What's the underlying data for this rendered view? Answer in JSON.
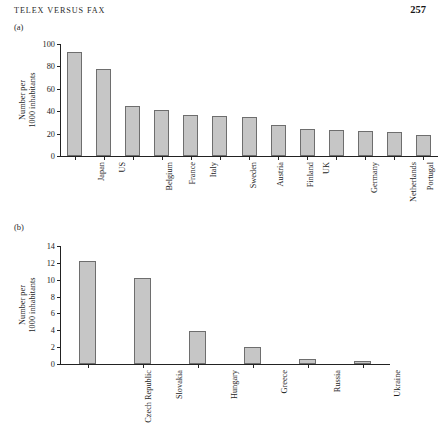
{
  "page": {
    "running_head": "TELEX VERSUS FAX",
    "folio": "257"
  },
  "figures": [
    {
      "label": "(a)",
      "chart_key": "a"
    },
    {
      "label": "(b)",
      "chart_key": "b"
    }
  ],
  "chart_data": [
    {
      "type": "bar",
      "panel": "(a)",
      "title": "",
      "xlabel": "",
      "ylabel": "Number per 1000 inhabitants",
      "ylabel_lines": [
        "Number per",
        "1000 inhabitants"
      ],
      "ylim": [
        0,
        100
      ],
      "yticks": [
        0,
        20,
        40,
        60,
        80,
        100
      ],
      "ytick_labels": [
        "0",
        "20",
        "40",
        "60",
        "80",
        "100"
      ],
      "grid": false,
      "legend": false,
      "categories": [
        "Japan",
        "US",
        "Belgium",
        "France",
        "Italy",
        "Sweden",
        "Austria",
        "Finland",
        "UK",
        "Germany",
        "Netherlands",
        "Portugal",
        "Spain"
      ],
      "values": [
        93,
        77.5,
        45,
        41.5,
        36.5,
        36,
        35,
        27.5,
        24,
        23.5,
        22.5,
        21.5,
        18.5
      ]
    },
    {
      "type": "bar",
      "panel": "(b)",
      "title": "",
      "xlabel": "",
      "ylabel": "Number per 1000 inhabitants",
      "ylabel_lines": [
        "Number per",
        "1000 inhabitants"
      ],
      "ylim": [
        0,
        14
      ],
      "yticks": [
        0,
        2,
        4,
        6,
        8,
        10,
        12,
        14
      ],
      "ytick_labels": [
        "0",
        "2",
        "4",
        "6",
        "8",
        "10",
        "12",
        "14"
      ],
      "grid": false,
      "legend": false,
      "categories": [
        "Czech Republic",
        "Slovakia",
        "Hungary",
        "Greece",
        "Russia",
        "Ukraine"
      ],
      "values": [
        12.2,
        10.2,
        3.9,
        2.0,
        0.6,
        0.4
      ]
    }
  ]
}
